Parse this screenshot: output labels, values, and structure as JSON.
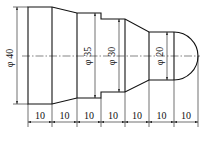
{
  "drawing": {
    "type": "shaft-profile",
    "colors": {
      "line": "#111111",
      "centerline": "#333333",
      "background": "#ffffff"
    },
    "diameters": [
      {
        "label": "φ 40",
        "value": 40
      },
      {
        "label": "φ 35",
        "value": 35
      },
      {
        "label": "φ 30",
        "value": 30
      },
      {
        "label": "φ 20",
        "value": 20
      }
    ],
    "lengths": [
      {
        "label": "10",
        "value": 10
      },
      {
        "label": "10",
        "value": 10
      },
      {
        "label": "10",
        "value": 10
      },
      {
        "label": "10",
        "value": 10
      },
      {
        "label": "10",
        "value": 10
      },
      {
        "label": "10",
        "value": 10
      },
      {
        "label": "10",
        "value": 10
      }
    ]
  }
}
